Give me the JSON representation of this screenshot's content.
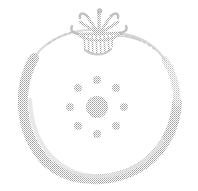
{
  "artwork": {
    "title": "Fruit outline with star calyx and sun rosette",
    "subject": "tomato-like fruit",
    "style": "halftone dithered line drawing",
    "medium": "monochrome stamp / engraving impression",
    "canvas": {
      "width": 198,
      "height": 191,
      "background_color": "#ffffff"
    },
    "ink": {
      "stroke_color": "#b9b9b9",
      "stroke_color_light": "#cfcfcf",
      "stroke_color_faint": "#dedede",
      "motif_color": "#c2c2c2",
      "calyx_color": "#bdbdbd"
    }
  },
  "elements": {
    "body_outline": {
      "name": "fruit-body-outline",
      "description": "thick soft rounded outline forming the body of the fruit, heavier on the lower left, lower right and bottom, fading to a hairline across the top shoulders",
      "left_extent_x": 22,
      "right_extent_x": 178,
      "top_extent_y": 28,
      "bottom_extent_y": 178,
      "stroke_width_max": 11,
      "stroke_width_min": 1
    },
    "calyx": {
      "name": "fruit-calyx-stem",
      "description": "star shaped leafy calyx with radiating points and vertical hatch strokes below, sitting on the top center of the fruit",
      "center_x": 99,
      "center_y": 32,
      "width": 46,
      "height": 42,
      "points": 7
    },
    "whisker": {
      "name": "calyx-whisker",
      "description": "thin hairline tendril extending to the right from the calyx",
      "start_x": 118,
      "start_y": 36,
      "end_x": 140,
      "end_y": 40
    },
    "rosette": {
      "name": "sun-rosette-motif",
      "description": "central filled disc ringed by eight evenly spaced small dots",
      "center_x": 97,
      "center_y": 107,
      "core_radius": 11,
      "satellite_radius": 4,
      "satellite_count": 8,
      "ring_radius": 27,
      "satellites": [
        {
          "label": "north",
          "cx": 97,
          "cy": 80
        },
        {
          "label": "northeast",
          "cx": 116,
          "cy": 88
        },
        {
          "label": "east",
          "cx": 124,
          "cy": 107
        },
        {
          "label": "southeast",
          "cx": 116,
          "cy": 126
        },
        {
          "label": "south",
          "cx": 97,
          "cy": 134
        },
        {
          "label": "southwest",
          "cx": 78,
          "cy": 126
        },
        {
          "label": "west",
          "cx": 70,
          "cy": 107
        },
        {
          "label": "northwest",
          "cx": 78,
          "cy": 88
        }
      ]
    }
  }
}
